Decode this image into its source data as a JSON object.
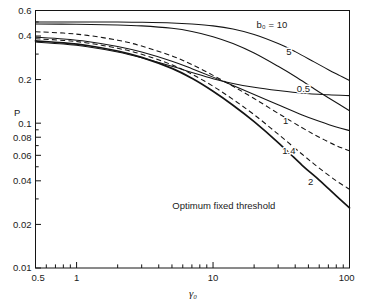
{
  "chart_data": {
    "type": "line",
    "title": "",
    "xlabel": "γ₀",
    "ylabel": "P",
    "xscale": "log",
    "yscale": "log",
    "xlim": [
      0.5,
      100
    ],
    "ylim": [
      0.01,
      0.6
    ],
    "grid": false,
    "legend_position": "inline-curve-labels",
    "x_tick_labels": [
      "0.5",
      "1",
      "10",
      "100"
    ],
    "x_tick_values": [
      0.5,
      1,
      10,
      100
    ],
    "y_tick_labels": [
      "0.6",
      "0.4",
      "0.2",
      "0.1",
      "0.08",
      "0.06",
      "0.04",
      "0.02",
      "0.01"
    ],
    "y_tick_values": [
      0.6,
      0.4,
      0.2,
      0.1,
      0.08,
      0.06,
      0.04,
      0.02,
      0.01
    ],
    "annotations": [
      {
        "text": "Optimum fixed threshold",
        "x": 12.0,
        "y": 0.0255
      }
    ],
    "series": [
      {
        "name": "b0 = 10",
        "label": "b₀ = 10",
        "style": "solid",
        "label_x": 27.0,
        "label_y": 0.455,
        "points": [
          [
            0.5,
            0.5
          ],
          [
            1.0,
            0.5
          ],
          [
            2.0,
            0.499
          ],
          [
            3.0,
            0.497
          ],
          [
            5.0,
            0.492
          ],
          [
            7.0,
            0.484
          ],
          [
            10.0,
            0.47
          ],
          [
            14.0,
            0.447
          ],
          [
            20.0,
            0.41
          ],
          [
            30.0,
            0.355
          ],
          [
            40.0,
            0.312
          ],
          [
            55.0,
            0.265
          ],
          [
            70.0,
            0.234
          ],
          [
            85.0,
            0.213
          ],
          [
            100.0,
            0.197
          ]
        ]
      },
      {
        "name": "5",
        "label": "5",
        "style": "solid",
        "label_x": 36.0,
        "label_y": 0.296,
        "points": [
          [
            0.5,
            0.484
          ],
          [
            1.0,
            0.482
          ],
          [
            2.0,
            0.477
          ],
          [
            3.0,
            0.47
          ],
          [
            5.0,
            0.452
          ],
          [
            7.0,
            0.43
          ],
          [
            10.0,
            0.396
          ],
          [
            14.0,
            0.355
          ],
          [
            20.0,
            0.305
          ],
          [
            30.0,
            0.247
          ],
          [
            40.0,
            0.21
          ],
          [
            55.0,
            0.173
          ],
          [
            70.0,
            0.15
          ],
          [
            85.0,
            0.134
          ],
          [
            100.0,
            0.122
          ]
        ]
      },
      {
        "name": "0.5",
        "label": "0.5",
        "style": "solid",
        "label_x": 46.0,
        "label_y": 0.163,
        "points": [
          [
            0.5,
            0.363
          ],
          [
            0.8,
            0.352
          ],
          [
            1.2,
            0.337
          ],
          [
            2.0,
            0.31
          ],
          [
            3.0,
            0.283
          ],
          [
            5.0,
            0.247
          ],
          [
            7.0,
            0.224
          ],
          [
            10.0,
            0.203
          ],
          [
            14.0,
            0.188
          ],
          [
            20.0,
            0.177
          ],
          [
            30.0,
            0.168
          ],
          [
            45.0,
            0.161
          ],
          [
            70.0,
            0.157
          ],
          [
            100.0,
            0.155
          ]
        ]
      },
      {
        "name": "1",
        "label": "1",
        "style": "solid",
        "label_x": 34.0,
        "label_y": 0.099,
        "points": [
          [
            0.5,
            0.393
          ],
          [
            0.8,
            0.382
          ],
          [
            1.2,
            0.367
          ],
          [
            2.0,
            0.339
          ],
          [
            3.0,
            0.31
          ],
          [
            5.0,
            0.268
          ],
          [
            7.0,
            0.238
          ],
          [
            10.0,
            0.208
          ],
          [
            14.0,
            0.182
          ],
          [
            20.0,
            0.158
          ],
          [
            30.0,
            0.134
          ],
          [
            45.0,
            0.114
          ],
          [
            60.0,
            0.103
          ],
          [
            80.0,
            0.094
          ],
          [
            100.0,
            0.089
          ]
        ]
      },
      {
        "name": "1.4",
        "label": "1.4",
        "style": "dashed",
        "label_x": 36.0,
        "label_y": 0.0615,
        "points": [
          [
            0.5,
            0.428
          ],
          [
            0.8,
            0.419
          ],
          [
            1.2,
            0.404
          ],
          [
            2.0,
            0.374
          ],
          [
            3.0,
            0.341
          ],
          [
            5.0,
            0.291
          ],
          [
            7.0,
            0.254
          ],
          [
            10.0,
            0.214
          ],
          [
            14.0,
            0.18
          ],
          [
            20.0,
            0.148
          ],
          [
            30.0,
            0.117
          ],
          [
            45.0,
            0.093
          ],
          [
            60.0,
            0.08
          ],
          [
            80.0,
            0.07
          ],
          [
            100.0,
            0.0645
          ]
        ]
      },
      {
        "name": "2",
        "label": "2",
        "style": "dashed",
        "label_x": 52.0,
        "label_y": 0.0375,
        "points": [
          [
            0.5,
            0.383
          ],
          [
            0.8,
            0.373
          ],
          [
            1.2,
            0.358
          ],
          [
            2.0,
            0.329
          ],
          [
            3.0,
            0.299
          ],
          [
            5.0,
            0.253
          ],
          [
            7.0,
            0.218
          ],
          [
            10.0,
            0.18
          ],
          [
            14.0,
            0.146
          ],
          [
            20.0,
            0.1145
          ],
          [
            30.0,
            0.084
          ],
          [
            45.0,
            0.061
          ],
          [
            60.0,
            0.049
          ],
          [
            80.0,
            0.04
          ],
          [
            100.0,
            0.035
          ]
        ]
      },
      {
        "name": "Optimum fixed threshold",
        "label": "",
        "style": "thick",
        "label_x": null,
        "label_y": null,
        "points": [
          [
            0.5,
            0.37
          ],
          [
            0.8,
            0.359
          ],
          [
            1.2,
            0.344
          ],
          [
            2.0,
            0.315
          ],
          [
            3.0,
            0.285
          ],
          [
            5.0,
            0.239
          ],
          [
            7.0,
            0.204
          ],
          [
            10.0,
            0.166
          ],
          [
            14.0,
            0.133
          ],
          [
            20.0,
            0.1025
          ],
          [
            30.0,
            0.0735
          ],
          [
            45.0,
            0.0512
          ],
          [
            60.0,
            0.0405
          ],
          [
            80.0,
            0.0315
          ],
          [
            100.0,
            0.026
          ]
        ]
      }
    ]
  }
}
